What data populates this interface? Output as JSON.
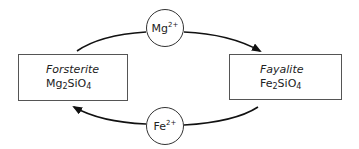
{
  "diagram": {
    "type": "cycle",
    "nodes": {
      "forsterite": {
        "name": "Forsterite",
        "formula_parts": [
          "Mg",
          "2",
          "SiO",
          "4"
        ]
      },
      "fayalite": {
        "name": "Fayalite",
        "formula_parts": [
          "Fe",
          "2",
          "SiO",
          "4"
        ]
      }
    },
    "ions": {
      "mg": {
        "symbol": "Mg",
        "charge": "2+"
      },
      "fe": {
        "symbol": "Fe",
        "charge": "2+"
      }
    },
    "edges": [
      {
        "from": "Forsterite",
        "via": "Mg2+",
        "to": "Fayalite",
        "direction": "top, left to right"
      },
      {
        "from": "Fayalite",
        "via": "Fe2+",
        "to": "Forsterite",
        "direction": "bottom, right to left"
      }
    ],
    "colors": {
      "stroke": "#111111",
      "box_border": "#555555",
      "text": "#222222",
      "background": "#ffffff"
    }
  }
}
